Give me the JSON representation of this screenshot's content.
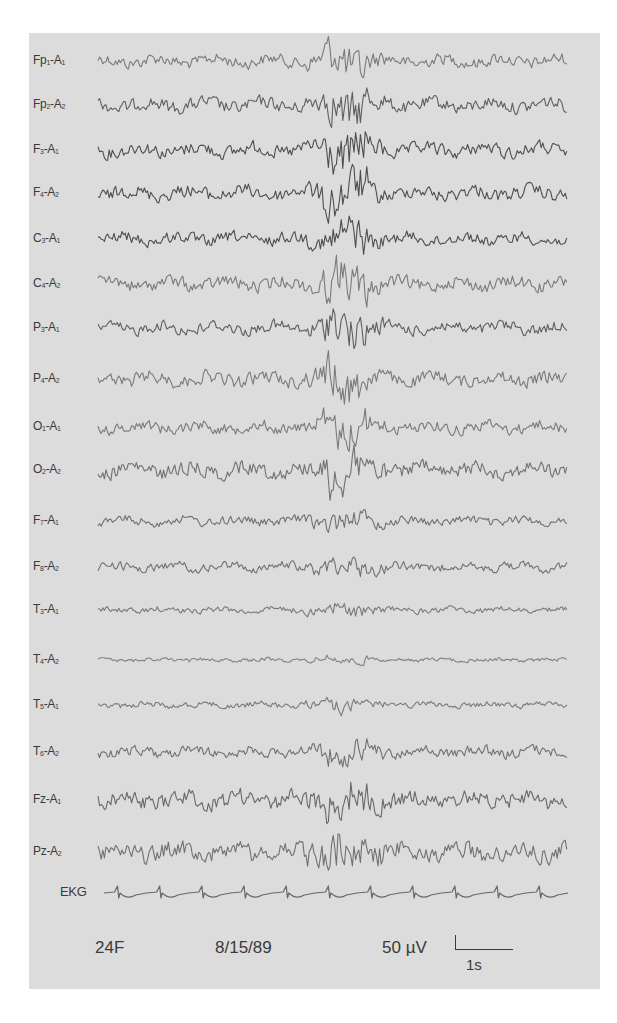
{
  "figure": {
    "type": "EEG recording (referential montage)",
    "channels": [
      {
        "name": "Fp1-A1",
        "base": "Fp",
        "sub1": "1",
        "ref": "A",
        "sub2": "1",
        "y": 61,
        "amp": 8,
        "dark": 0.55
      },
      {
        "name": "Fp2-A2",
        "base": "Fp",
        "sub1": "2",
        "ref": "A",
        "sub2": "2",
        "y": 105,
        "amp": 9,
        "dark": 0.7
      },
      {
        "name": "F3-A1",
        "base": "F",
        "sub1": "3",
        "ref": "A",
        "sub2": "1",
        "y": 150,
        "amp": 9,
        "dark": 0.8
      },
      {
        "name": "F4-A2",
        "base": "F",
        "sub1": "4",
        "ref": "A",
        "sub2": "2",
        "y": 193,
        "amp": 9,
        "dark": 0.8
      },
      {
        "name": "C3-A1",
        "base": "C",
        "sub1": "3",
        "ref": "A",
        "sub2": "1",
        "y": 239,
        "amp": 8,
        "dark": 0.8
      },
      {
        "name": "C4-A2",
        "base": "C",
        "sub1": "4",
        "ref": "A",
        "sub2": "2",
        "y": 284,
        "amp": 9,
        "dark": 0.55
      },
      {
        "name": "P3-A1",
        "base": "P",
        "sub1": "3",
        "ref": "A",
        "sub2": "1",
        "y": 328,
        "amp": 8,
        "dark": 0.7
      },
      {
        "name": "P4-A2",
        "base": "P",
        "sub1": "4",
        "ref": "A",
        "sub2": "2",
        "y": 379,
        "amp": 9,
        "dark": 0.55
      },
      {
        "name": "O1-A1",
        "base": "O",
        "sub1": "1",
        "ref": "A",
        "sub2": "1",
        "y": 427,
        "amp": 8,
        "dark": 0.55
      },
      {
        "name": "O2-A2",
        "base": "O",
        "sub1": "2",
        "ref": "A",
        "sub2": "2",
        "y": 470,
        "amp": 10,
        "dark": 0.6
      },
      {
        "name": "F7-A1",
        "base": "F",
        "sub1": "7",
        "ref": "A",
        "sub2": "1",
        "y": 521,
        "amp": 6,
        "dark": 0.6
      },
      {
        "name": "F8-A2",
        "base": "F",
        "sub1": "8",
        "ref": "A",
        "sub2": "2",
        "y": 567,
        "amp": 6,
        "dark": 0.6
      },
      {
        "name": "T3-A1",
        "base": "T",
        "sub1": "3",
        "ref": "A",
        "sub2": "1",
        "y": 610,
        "amp": 4,
        "dark": 0.55
      },
      {
        "name": "T4-A2",
        "base": "T",
        "sub1": "4",
        "ref": "A",
        "sub2": "2",
        "y": 660,
        "amp": 2.5,
        "dark": 0.5
      },
      {
        "name": "T5-A1",
        "base": "T",
        "sub1": "5",
        "ref": "A",
        "sub2": "1",
        "y": 705,
        "amp": 4,
        "dark": 0.55
      },
      {
        "name": "T6-A2",
        "base": "T",
        "sub1": "6",
        "ref": "A",
        "sub2": "2",
        "y": 752,
        "amp": 7,
        "dark": 0.6
      },
      {
        "name": "Fz-A1",
        "base": "Fz",
        "sub1": "",
        "ref": "A",
        "sub2": "1",
        "y": 800,
        "amp": 11,
        "dark": 0.65
      },
      {
        "name": "Pz-A2",
        "base": "Pz",
        "sub1": "",
        "ref": "A",
        "sub2": "2",
        "y": 852,
        "amp": 12,
        "dark": 0.6
      },
      {
        "name": "EKG",
        "base": "EKG",
        "sub1": "",
        "ref": "",
        "sub2": "",
        "y": 893,
        "amp": 0,
        "dark": 0.65,
        "ekg": true
      }
    ],
    "trace_x_start": 98,
    "trace_x_end": 568,
    "spike_center_x": 345,
    "ekg_beats": 11,
    "footer": {
      "patient": "24F",
      "date": "8/15/89",
      "amplitude_scale": "50 µV",
      "time_scale": "1s"
    },
    "colors": {
      "page_bg": "#ffffff",
      "panel_bg": "#dcdcdc",
      "ink": "#3a3a3a"
    }
  }
}
